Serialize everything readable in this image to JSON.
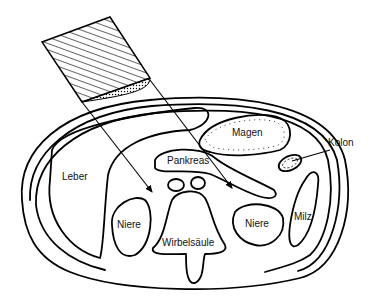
{
  "diagram": {
    "type": "anatomical cross-section",
    "labels": {
      "liver": "Leber",
      "stomach": "Magen",
      "pancreas": "Pankreas",
      "colon": "Kolon",
      "kidney_left": "Niere",
      "kidney_right": "Niere",
      "spleen": "Milz",
      "spine": "Wirbelsäule"
    },
    "colors": {
      "line": "#000000",
      "background": "#ffffff"
    }
  }
}
